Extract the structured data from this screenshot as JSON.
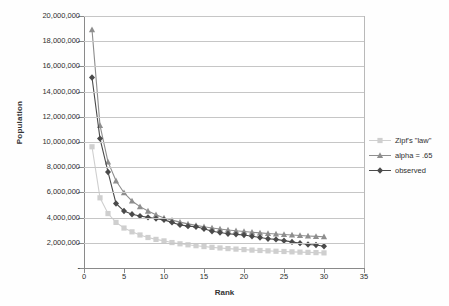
{
  "chart_data": {
    "type": "line",
    "title": "",
    "xlabel": "Rank",
    "ylabel": "Population",
    "xlim": [
      0,
      35
    ],
    "ylim": [
      0,
      20000000
    ],
    "grid": true,
    "legend_position": "right",
    "x_ticks": [
      "0",
      "5",
      "10",
      "15",
      "20",
      "25",
      "30",
      "35"
    ],
    "x_tick_values": [
      0,
      5,
      10,
      15,
      20,
      25,
      30,
      35
    ],
    "y_ticks": [
      "-",
      "2,000,000",
      "4,000,000",
      "6,000,000",
      "8,000,000",
      "10,000,000",
      "12,000,000",
      "14,000,000",
      "16,000,000",
      "18,000,000",
      "20,000,000"
    ],
    "y_tick_values": [
      0,
      2000000,
      4000000,
      6000000,
      8000000,
      10000000,
      12000000,
      14000000,
      16000000,
      18000000,
      20000000
    ],
    "x": [
      1,
      2,
      3,
      4,
      5,
      6,
      7,
      8,
      9,
      10,
      11,
      12,
      13,
      14,
      15,
      16,
      17,
      18,
      19,
      20,
      21,
      22,
      23,
      24,
      25,
      26,
      27,
      28,
      29,
      30
    ],
    "series": [
      {
        "name": "Zipf's \"law\"",
        "marker": "square",
        "color": "#cfcfcf",
        "values": [
          9700000,
          5650000,
          4400000,
          3700000,
          3250000,
          2950000,
          2700000,
          2500000,
          2350000,
          2230000,
          2100000,
          2000000,
          1920000,
          1850000,
          1780000,
          1720000,
          1670000,
          1620000,
          1580000,
          1540000,
          1500000,
          1470000,
          1440000,
          1410000,
          1390000,
          1360000,
          1340000,
          1320000,
          1300000,
          1280000
        ]
      },
      {
        "name": "alpha = .65",
        "marker": "triangle",
        "color": "#8e8e8e",
        "values": [
          19000000,
          11400000,
          8500000,
          7000000,
          6050000,
          5400000,
          4950000,
          4600000,
          4300000,
          4050000,
          3880000,
          3720000,
          3580000,
          3460000,
          3350000,
          3260000,
          3180000,
          3100000,
          3030000,
          2980000,
          2920000,
          2870000,
          2820000,
          2780000,
          2740000,
          2700000,
          2660000,
          2620000,
          2590000,
          2560000
        ]
      },
      {
        "name": "observed",
        "marker": "diamond",
        "color": "#4a4a4a",
        "values": [
          15200000,
          10350000,
          7700000,
          5200000,
          4600000,
          4350000,
          4200000,
          4100000,
          4000000,
          3900000,
          3700000,
          3500000,
          3400000,
          3350000,
          3200000,
          3000000,
          2900000,
          2800000,
          2750000,
          2700000,
          2600000,
          2500000,
          2400000,
          2350000,
          2250000,
          2150000,
          2050000,
          1950000,
          1900000,
          1800000
        ]
      }
    ]
  }
}
